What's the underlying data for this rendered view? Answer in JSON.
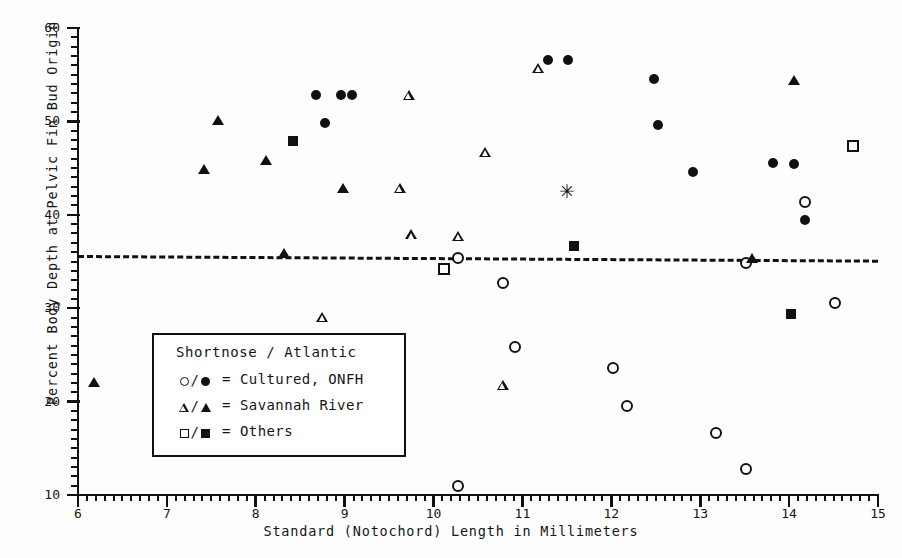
{
  "chart_data": {
    "type": "scatter",
    "title": "",
    "xlabel": "Standard (Notochord) Length in Millimeters",
    "ylabel": "Percent Body Depth at Pelvic Fin Bud Origin",
    "xlim": [
      6,
      15
    ],
    "ylim": [
      10,
      60
    ],
    "xticks": [
      6,
      7,
      8,
      9,
      10,
      11,
      12,
      13,
      14,
      15
    ],
    "yticks": [
      10,
      20,
      30,
      40,
      50,
      60
    ],
    "x_minor_interval": 0.1,
    "y_minor_interval": 1,
    "grid": false,
    "legend_position": "lower-left-inset",
    "reference_line": {
      "style": "dashed",
      "y_start": 35.7,
      "y_end": 35.2,
      "x_start": 6.0,
      "x_end": 15.0,
      "label": ""
    },
    "series": [
      {
        "name": "Shortnose, Cultured ONFH",
        "marker": "circle-open",
        "points": [
          [
            10.28,
            35.4
          ],
          [
            10.28,
            11.0
          ],
          [
            10.78,
            32.7
          ],
          [
            10.92,
            25.8
          ],
          [
            12.02,
            23.6
          ],
          [
            12.18,
            19.5
          ],
          [
            13.18,
            16.6
          ],
          [
            13.52,
            12.8
          ],
          [
            13.52,
            34.8
          ],
          [
            14.18,
            41.4
          ],
          [
            14.52,
            30.6
          ]
        ]
      },
      {
        "name": "Atlantic, Cultured ONFH",
        "marker": "circle-filled",
        "points": [
          [
            8.68,
            52.8
          ],
          [
            8.78,
            49.8
          ],
          [
            8.96,
            52.8
          ],
          [
            9.08,
            52.8
          ],
          [
            11.29,
            56.6
          ],
          [
            11.51,
            56.6
          ],
          [
            12.48,
            54.5
          ],
          [
            12.52,
            49.6
          ],
          [
            12.92,
            44.6
          ],
          [
            13.82,
            45.5
          ],
          [
            14.05,
            45.4
          ],
          [
            14.18,
            39.4
          ]
        ]
      },
      {
        "name": "Shortnose, Savannah River",
        "marker": "triangle-open",
        "points": [
          [
            8.75,
            29.1
          ],
          [
            9.62,
            42.9
          ],
          [
            9.72,
            52.8
          ],
          [
            9.75,
            37.9
          ],
          [
            10.28,
            37.7
          ],
          [
            10.58,
            46.7
          ],
          [
            10.78,
            21.8
          ],
          [
            11.18,
            55.7
          ]
        ]
      },
      {
        "name": "Atlantic, Savannah River",
        "marker": "triangle-filled",
        "points": [
          [
            6.18,
            22.1
          ],
          [
            7.42,
            44.9
          ],
          [
            7.58,
            50.1
          ],
          [
            8.12,
            45.9
          ],
          [
            8.32,
            35.9
          ],
          [
            8.98,
            42.9
          ],
          [
            13.58,
            35.4
          ],
          [
            14.05,
            54.4
          ]
        ]
      },
      {
        "name": "Shortnose, Others",
        "marker": "square-open",
        "points": [
          [
            10.12,
            34.2
          ],
          [
            14.72,
            47.4
          ]
        ]
      },
      {
        "name": "Atlantic, Others",
        "marker": "square-filled",
        "points": [
          [
            8.42,
            47.9
          ],
          [
            11.58,
            36.7
          ],
          [
            14.02,
            29.4
          ]
        ]
      },
      {
        "name": "Unclassified",
        "marker": "asterisk",
        "points": [
          [
            11.49,
            42.4
          ]
        ]
      }
    ]
  },
  "legend": {
    "title": "Shortnose / Atlantic",
    "rows": [
      {
        "symbols": "circle",
        "equals": "=",
        "label": "Cultured, ONFH"
      },
      {
        "symbols": "triangle",
        "equals": "=",
        "label": "Savannah River"
      },
      {
        "symbols": "square",
        "equals": "=",
        "label": "Others"
      }
    ]
  },
  "axes": {
    "x_tick_labels": [
      "6",
      "7",
      "8",
      "9",
      "10",
      "11",
      "12",
      "13",
      "14",
      "15"
    ],
    "y_tick_labels": [
      "10",
      "20",
      "30",
      "40",
      "50",
      "60"
    ]
  },
  "colors": {
    "foreground": "#111111",
    "background": "#ffffff"
  }
}
